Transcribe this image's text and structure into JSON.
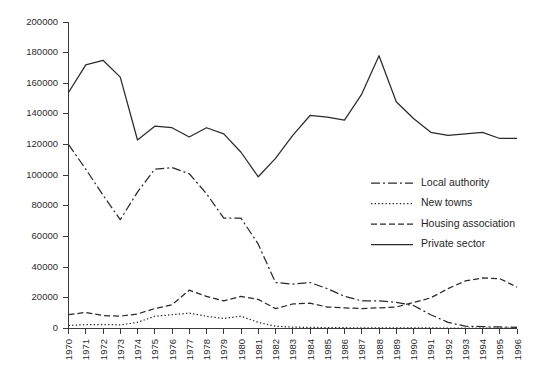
{
  "chart_data": {
    "type": "line",
    "title": "",
    "subtitle": "",
    "xlabel": "",
    "ylabel": "",
    "xlim": [
      1970,
      1996
    ],
    "ylim": [
      0,
      200000
    ],
    "grid": false,
    "legend_position": "center-right",
    "x": [
      1970,
      1971,
      1972,
      1973,
      1974,
      1975,
      1976,
      1977,
      1978,
      1979,
      1980,
      1981,
      1982,
      1983,
      1984,
      1985,
      1986,
      1987,
      1988,
      1989,
      1990,
      1991,
      1992,
      1993,
      1994,
      1995,
      1996
    ],
    "xtick_labels": [
      "1970",
      "1971",
      "1972",
      "1973",
      "1974",
      "1975",
      "1976",
      "1977",
      "1978",
      "1979",
      "1980",
      "1981",
      "1982",
      "1983",
      "1984",
      "1985",
      "1986",
      "1987",
      "1988",
      "1989",
      "1990",
      "1991",
      "1992",
      "1993",
      "1994",
      "1995",
      "1996"
    ],
    "ytick_values": [
      0,
      20000,
      40000,
      60000,
      80000,
      100000,
      120000,
      140000,
      160000,
      180000,
      200000
    ],
    "ytick_labels": [
      "0",
      "20000",
      "40000",
      "60000",
      "80000",
      "100000",
      "120000",
      "140000",
      "160000",
      "180000",
      "200000"
    ],
    "series": [
      {
        "name": "Local authority",
        "style": "dashdot",
        "dash_pattern": "9,3,2,3",
        "color": "#2a2a2a",
        "values": [
          120000,
          104000,
          87000,
          71000,
          89000,
          104000,
          105000,
          101000,
          88000,
          72000,
          72000,
          55000,
          30000,
          29000,
          30000,
          26000,
          21000,
          18000,
          18000,
          17000,
          15000,
          9000,
          4000,
          1500,
          1200,
          1000,
          800
        ]
      },
      {
        "name": "New towns",
        "style": "dotted",
        "dash_pattern": "1.4,2.2",
        "color": "#2a2a2a",
        "values": [
          2000,
          2500,
          2600,
          2400,
          4000,
          8000,
          9000,
          10000,
          8000,
          6500,
          8000,
          4000,
          1500,
          900,
          700,
          600,
          500,
          450,
          400,
          380,
          350,
          330,
          320,
          300,
          300,
          280,
          270
        ]
      },
      {
        "name": "Housing association",
        "style": "dashed",
        "dash_pattern": "6,3",
        "color": "#2a2a2a",
        "values": [
          9000,
          10500,
          8500,
          8000,
          9500,
          13000,
          15500,
          25000,
          21000,
          18000,
          21000,
          19000,
          13000,
          16000,
          16500,
          14000,
          13500,
          13000,
          13500,
          14000,
          17000,
          20000,
          26000,
          31000,
          33000,
          32500,
          27000
        ]
      },
      {
        "name": "Private sector",
        "style": "solid",
        "dash_pattern": "",
        "color": "#2a2a2a",
        "values": [
          154000,
          172000,
          175000,
          164000,
          123000,
          132000,
          131000,
          125000,
          131000,
          127000,
          115000,
          99000,
          111000,
          126000,
          139000,
          138000,
          136000,
          153000,
          178000,
          148000,
          137000,
          128000,
          126000,
          127000,
          128000,
          124000,
          124000
        ]
      }
    ]
  },
  "legend": {
    "items": [
      {
        "label": "Local authority"
      },
      {
        "label": "New towns"
      },
      {
        "label": "Housing association"
      },
      {
        "label": "Private sector"
      }
    ]
  }
}
